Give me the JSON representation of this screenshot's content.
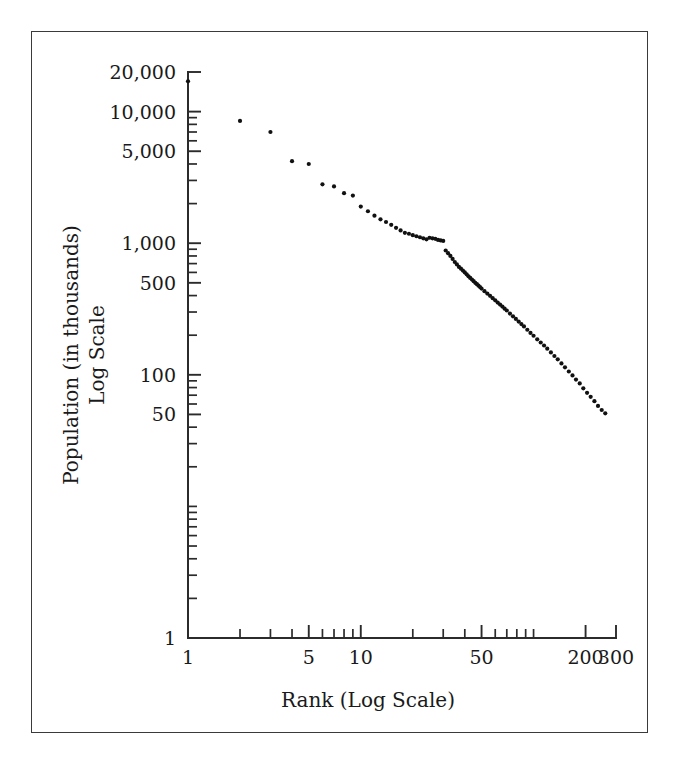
{
  "figure": {
    "frame_color": "#3a3a3a",
    "background": "#ffffff",
    "point_color": "#111111",
    "axis_color": "#2b2b2b"
  },
  "chart_data": {
    "type": "scatter",
    "title": "",
    "xlabel": "Rank (Log Scale)",
    "ylabel_line1": "Population (in thousands)",
    "ylabel_line2": "Log Scale",
    "xscale": "log",
    "yscale": "log",
    "xlim": [
      1,
      300
    ],
    "ylim": [
      1,
      20000
    ],
    "grid": false,
    "legend": null,
    "x_tick_labels": [
      "1",
      "5",
      "10",
      "50",
      "200",
      "300"
    ],
    "x_tick_values": [
      1,
      5,
      10,
      50,
      200,
      300
    ],
    "x_minor_ticks": [
      2,
      3,
      4,
      5,
      6,
      7,
      8,
      9,
      10,
      20,
      30,
      40,
      50,
      60,
      70,
      80,
      90,
      100,
      200,
      300
    ],
    "y_tick_labels": [
      "20,000",
      "10,000",
      "5,000",
      "1,000",
      "500",
      "100",
      "50",
      "1"
    ],
    "y_tick_values": [
      20000,
      10000,
      5000,
      1000,
      500,
      100,
      50,
      1
    ],
    "y_minor_ticks": [
      2,
      3,
      4,
      5,
      6,
      7,
      8,
      9,
      10,
      20,
      30,
      40,
      50,
      60,
      70,
      80,
      90,
      100,
      200,
      300,
      400,
      500,
      600,
      700,
      800,
      900,
      1000,
      2000,
      3000,
      4000,
      5000,
      6000,
      7000,
      8000,
      9000,
      10000,
      20000
    ],
    "x": [
      1,
      2,
      3,
      4,
      5,
      6,
      7,
      8,
      9,
      10,
      11,
      12,
      13,
      14,
      15,
      16,
      17,
      18,
      19,
      20,
      21,
      22,
      23,
      24,
      25,
      26,
      27,
      28,
      29,
      30,
      31,
      32,
      33,
      34,
      35,
      36,
      37,
      38,
      39,
      40,
      41,
      42,
      43,
      44,
      45,
      46,
      47,
      48,
      49,
      50,
      52,
      54,
      56,
      58,
      60,
      62,
      64,
      66,
      68,
      70,
      73,
      76,
      79,
      82,
      85,
      88,
      92,
      96,
      100,
      105,
      110,
      115,
      120,
      126,
      132,
      138,
      145,
      152,
      160,
      168,
      176,
      185,
      194,
      204,
      214,
      225,
      236,
      248,
      260
    ],
    "y": [
      17000,
      8500,
      7000,
      4200,
      4000,
      2800,
      2700,
      2400,
      2300,
      1900,
      1750,
      1620,
      1520,
      1450,
      1380,
      1310,
      1250,
      1200,
      1180,
      1150,
      1130,
      1110,
      1090,
      1070,
      1100,
      1090,
      1080,
      1060,
      1050,
      1040,
      880,
      840,
      800,
      760,
      720,
      690,
      660,
      640,
      620,
      600,
      580,
      560,
      545,
      530,
      515,
      500,
      488,
      476,
      464,
      452,
      432,
      414,
      398,
      382,
      368,
      354,
      342,
      330,
      318,
      308,
      292,
      278,
      266,
      254,
      243,
      233,
      220,
      208,
      198,
      186,
      176,
      167,
      158,
      148,
      139,
      131,
      122,
      114,
      106,
      99,
      92,
      86,
      79,
      73,
      68,
      63,
      58,
      54,
      51
    ],
    "point_count": 89,
    "point_radius": 2.1
  },
  "axes_geometry": {
    "left_px": 188,
    "right_px": 616,
    "top_px": 72,
    "bottom_px": 638
  }
}
